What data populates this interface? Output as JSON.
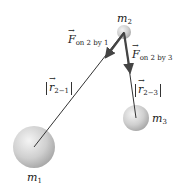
{
  "diagram": {
    "masses": [
      {
        "id": "m1",
        "symbol": "m",
        "subscript": "1",
        "cx": 34,
        "cy": 147,
        "r": 21
      },
      {
        "id": "m2",
        "symbol": "m",
        "subscript": "2",
        "cx": 124,
        "cy": 32,
        "r": 7
      },
      {
        "id": "m3",
        "symbol": "m",
        "subscript": "3",
        "cx": 136,
        "cy": 118,
        "r": 13
      }
    ],
    "forces": [
      {
        "symbol": "F",
        "subscript": "on 2 by 1"
      },
      {
        "symbol": "F",
        "subscript": "on 2 by 3"
      }
    ],
    "distances": [
      {
        "symbol": "r",
        "subscript": "2−1"
      },
      {
        "symbol": "r",
        "subscript": "2−3"
      }
    ],
    "colors": {
      "sphere_light": "#f2f2f2",
      "sphere_dark": "#a8a8a8",
      "line": "#333333",
      "arrow": "#444444"
    }
  }
}
